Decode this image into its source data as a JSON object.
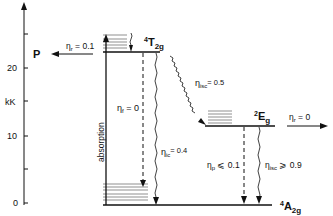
{
  "axis": {
    "unit_label": "kK",
    "ticks": [
      {
        "value": 0,
        "label": "0",
        "y": 203
      },
      {
        "value": 5,
        "label": "",
        "y": 169
      },
      {
        "value": 10,
        "label": "10",
        "y": 136
      },
      {
        "value": 15,
        "label": "",
        "y": 101
      },
      {
        "value": 20,
        "label": "20",
        "y": 68
      },
      {
        "value": 25,
        "label": "",
        "y": 34
      }
    ]
  },
  "levels": {
    "t2g": {
      "sup": "4",
      "main": "T",
      "sub": "2g"
    },
    "eg": {
      "sup": "2",
      "main": "E",
      "sub": "g"
    },
    "a2g": {
      "sup": "4",
      "main": "A",
      "sub": "2g"
    }
  },
  "labels": {
    "absorption": "absorption",
    "p_label": "P",
    "eta_r_p": {
      "sym": "η",
      "sub": "r",
      "val": " = 0.1"
    },
    "eta_f": {
      "sym": "η",
      "sub": "f",
      "val": " = 0"
    },
    "eta_isc_t": {
      "sym": "η",
      "sub": "isc",
      "val": "= 0.5"
    },
    "eta_ic": {
      "sym": "η",
      "sub": "ic",
      "val": "= 0.4"
    },
    "eta_r_e": {
      "sym": "η",
      "sub": "r",
      "val": " = 0"
    },
    "eta_p": {
      "sym": "η",
      "sub": "p",
      "val": " ⩽ 0.1"
    },
    "eta_isc_e": {
      "sym": "η",
      "sub": "isc",
      "val": " ⩾ 0.9"
    }
  }
}
